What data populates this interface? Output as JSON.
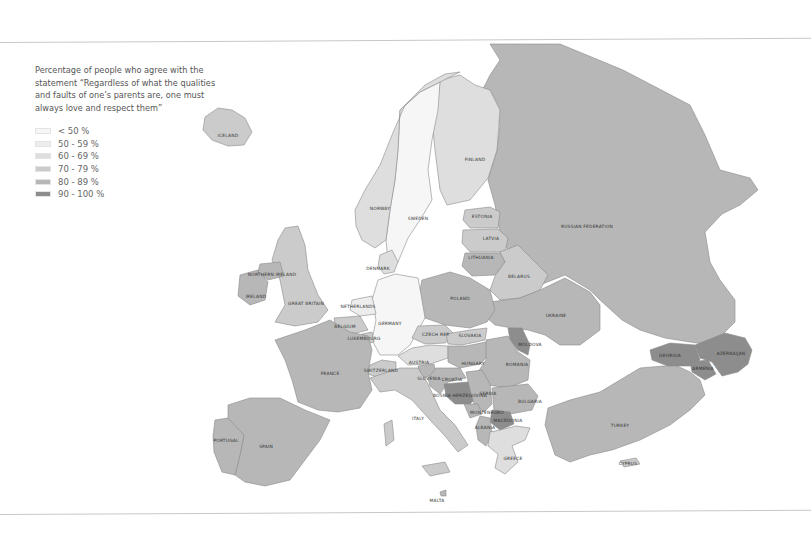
{
  "legend": {
    "title": "Percentage of people who agree with the statement “Regardless of what the qualities and faults of one’s parents are, one must always love and respect them”",
    "items": [
      {
        "label": "< 50 %",
        "color": "#f6f6f6"
      },
      {
        "label": "50 - 59 %",
        "color": "#ededed"
      },
      {
        "label": "60 - 69 %",
        "color": "#dedede"
      },
      {
        "label": "70 - 79 %",
        "color": "#cbcbcb"
      },
      {
        "label": "80 - 89 %",
        "color": "#b7b7b7"
      },
      {
        "label": "90 - 100 %",
        "color": "#8d8d8d"
      }
    ]
  },
  "countries": {
    "iceland": {
      "label": "ICELAND",
      "category": "70 - 79 %"
    },
    "norway": {
      "label": "NORWAY",
      "category": "60 - 69 %"
    },
    "sweden": {
      "label": "SWEDEN",
      "category": "< 50 %"
    },
    "finland": {
      "label": "FINLAND",
      "category": "60 - 69 %"
    },
    "russian_federation": {
      "label": "RUSSIAN FEDERATION",
      "category": "80 - 89 %"
    },
    "estonia": {
      "label": "ESTONIA",
      "category": "70 - 79 %"
    },
    "latvia": {
      "label": "LATVIA",
      "category": "70 - 79 %"
    },
    "lithuania": {
      "label": "LITHUANIA",
      "category": "80 - 89 %"
    },
    "belarus": {
      "label": "BELARUS",
      "category": "70 - 79 %"
    },
    "denmark": {
      "label": "DENMARK",
      "category": "60 - 69 %"
    },
    "northern_ireland": {
      "label": "NORTHERN IRELAND",
      "category": "80 - 89 %"
    },
    "ireland": {
      "label": "IRELAND",
      "category": "80 - 89 %"
    },
    "great_britain": {
      "label": "GREAT BRITAIN",
      "category": "70 - 79 %"
    },
    "netherlands": {
      "label": "NETHERLANDS",
      "category": "50 - 59 %"
    },
    "belgium": {
      "label": "BELGIUM",
      "category": "70 - 79 %"
    },
    "luxembourg": {
      "label": "LUXEMBOURG",
      "category": "70 - 79 %"
    },
    "germany": {
      "label": "GERMANY",
      "category": "< 50 %"
    },
    "poland": {
      "label": "POLAND",
      "category": "80 - 89 %"
    },
    "ukraine": {
      "label": "UKRAINE",
      "category": "80 - 89 %"
    },
    "czech_rep": {
      "label": "CZECH REP.",
      "category": "70 - 79 %"
    },
    "slovakia": {
      "label": "SLOVAKIA",
      "category": "70 - 79 %"
    },
    "moldova": {
      "label": "MOLDOVA",
      "category": "90 - 100 %"
    },
    "france": {
      "label": "FRANCE",
      "category": "80 - 89 %"
    },
    "switzerland": {
      "label": "SWITZERLAND",
      "category": "70 - 79 %"
    },
    "austria": {
      "label": "AUSTRIA",
      "category": "60 - 69 %"
    },
    "hungary": {
      "label": "HUNGARY",
      "category": "80 - 89 %"
    },
    "romania": {
      "label": "ROMANIA",
      "category": "80 - 89 %"
    },
    "slovenia": {
      "label": "SLOVENIA",
      "category": "80 - 89 %"
    },
    "croatia": {
      "label": "CROATIA",
      "category": "80 - 89 %"
    },
    "bosnia_herzegovina": {
      "label": "BOSNIA HERZEGOVINA",
      "category": "90 - 100 %"
    },
    "serbia": {
      "label": "SERBIA",
      "category": "80 - 89 %"
    },
    "bulgaria": {
      "label": "BULGARIA",
      "category": "80 - 89 %"
    },
    "montenegro": {
      "label": "MONTENEGRO",
      "category": "80 - 89 %"
    },
    "macedonia": {
      "label": "MACEDONIA",
      "category": "90 - 100 %"
    },
    "albania": {
      "label": "ALBANIA",
      "category": "80 - 89 %"
    },
    "georgia": {
      "label": "GEORGIA",
      "category": "90 - 100 %"
    },
    "armenia": {
      "label": "ARMENIA",
      "category": "90 - 100 %"
    },
    "azerbaijan": {
      "label": "AZERBAIJAN",
      "category": "90 - 100 %"
    },
    "portugal": {
      "label": "PORTUGAL",
      "category": "80 - 89 %"
    },
    "spain": {
      "label": "SPAIN",
      "category": "80 - 89 %"
    },
    "italy": {
      "label": "ITALY",
      "category": "70 - 79 %"
    },
    "greece": {
      "label": "GREECE",
      "category": "60 - 69 %"
    },
    "turkey": {
      "label": "TURKEY",
      "category": "80 - 89 %"
    },
    "cyprus": {
      "label": "CYPRUS",
      "category": "70 - 79 %"
    },
    "malta": {
      "label": "MALTA",
      "category": "80 - 89 %"
    }
  }
}
